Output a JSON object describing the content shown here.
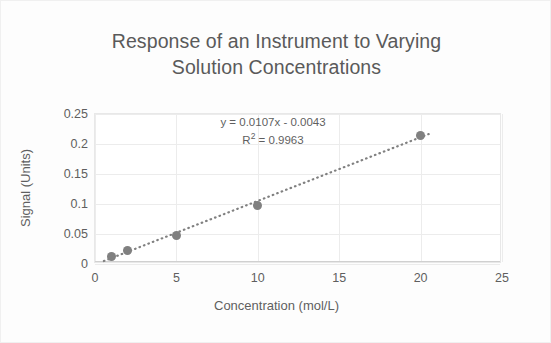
{
  "chart_data": {
    "type": "scatter",
    "title": "Response of an Instrument to Varying\nSolution Concentrations",
    "xlabel": "Concentration (mol/L)",
    "ylabel": "Signal (Units)",
    "xlim": [
      0,
      25
    ],
    "ylim": [
      0,
      0.25
    ],
    "xticks": [
      0,
      5,
      10,
      15,
      20,
      25
    ],
    "yticks": [
      0,
      0.05,
      0.1,
      0.15,
      0.2,
      0.25
    ],
    "xticklabels": [
      "0",
      "5",
      "10",
      "15",
      "20",
      "25"
    ],
    "yticklabels": [
      "0",
      "0.05",
      "0.1",
      "0.15",
      "0.2",
      "0.25"
    ],
    "grid": true,
    "legend": false,
    "x": [
      1,
      2,
      5,
      10,
      20
    ],
    "y": [
      0.012,
      0.023,
      0.048,
      0.097,
      0.215
    ],
    "series": [
      {
        "name": "Signal",
        "x": [
          1,
          2,
          5,
          10,
          20
        ],
        "values": [
          0.012,
          0.023,
          0.048,
          0.097,
          0.215
        ],
        "marker": "circle",
        "color": "#808080"
      }
    ],
    "trendline": {
      "type": "linear",
      "slope": 0.0107,
      "intercept": -0.0043,
      "r_squared": 0.9963,
      "style": "dotted",
      "color": "#808080",
      "equation_label": "y = 0.0107x - 0.0043",
      "r2_label_prefix": "R",
      "r2_label_exponent": "2",
      "r2_label_value": " = 0.9963"
    },
    "colors": {
      "marker": "#808080",
      "text": "#5f5f5f",
      "title_text": "#5a5a5a",
      "gridline": "#ececec",
      "plot_border": "#e8e8e8",
      "background": "#ffffff"
    }
  }
}
